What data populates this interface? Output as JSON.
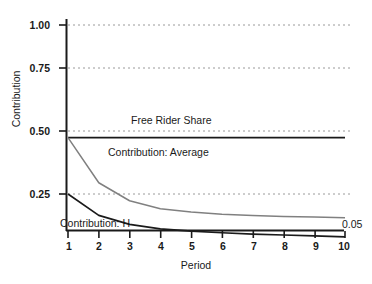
{
  "chart_data": {
    "type": "line",
    "title": "",
    "xlabel": "Period",
    "ylabel": "Contribution",
    "x": [
      1,
      2,
      3,
      4,
      5,
      6,
      7,
      8,
      9,
      10
    ],
    "xlim": [
      1,
      10
    ],
    "ylim": [
      0.11,
      1.06
    ],
    "grid": true,
    "gridstyle": "dotted-horizontal",
    "legend_position": "inline-annotations",
    "yticks": [
      "0.25",
      "0.50",
      "0.75",
      "1.00"
    ],
    "ytick_values": [
      0.25,
      0.5,
      0.75,
      1.0
    ],
    "xticks": [
      "1",
      "2",
      "3",
      "4",
      "5",
      "6",
      "7",
      "8",
      "9",
      "10"
    ],
    "series": [
      {
        "name": "Free Rider Share",
        "color": "#1a1a1a",
        "width": 1.7,
        "values": [
          0.5,
          0.5,
          0.5,
          0.5,
          0.5,
          0.5,
          0.5,
          0.5,
          0.5,
          0.5
        ]
      },
      {
        "name": "Contribution: Average",
        "color": "#808080",
        "width": 1.5,
        "values": [
          0.5,
          0.3,
          0.22,
          0.185,
          0.17,
          0.16,
          0.155,
          0.15,
          0.148,
          0.145
        ]
      },
      {
        "name": "Contribution: H",
        "color": "#1a1a1a",
        "width": 1.7,
        "values": [
          0.25,
          0.155,
          0.115,
          0.095,
          0.085,
          0.078,
          0.072,
          0.068,
          0.064,
          0.06
        ]
      }
    ],
    "annotations": [
      {
        "text": "0.05",
        "target": "Contribution: H",
        "at_x": 10
      }
    ]
  }
}
